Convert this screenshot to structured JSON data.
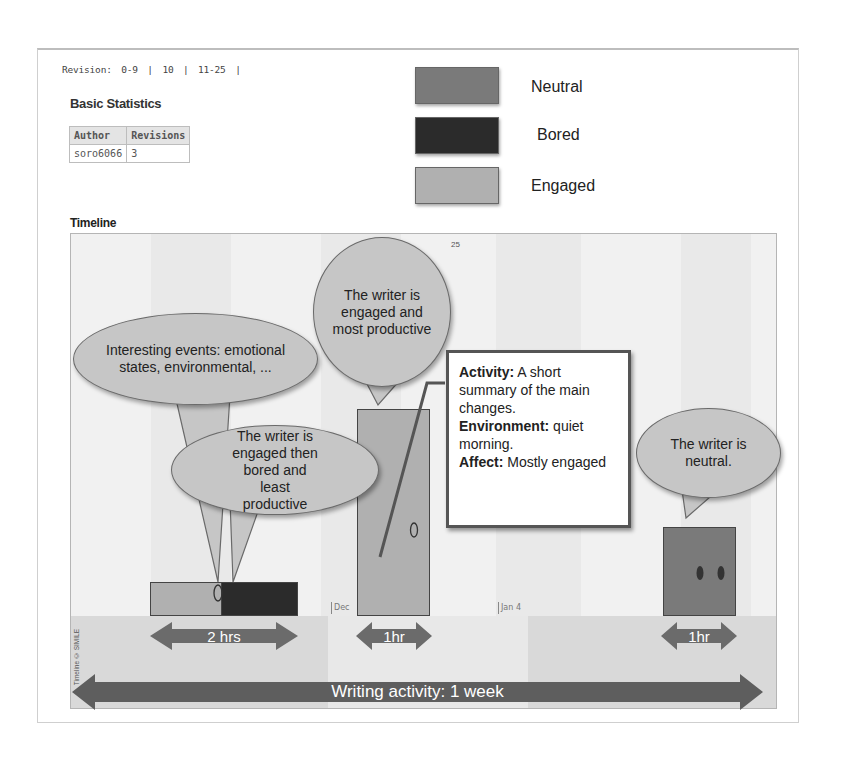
{
  "revisions": {
    "label": "Revision:",
    "links": [
      "0-9",
      "10",
      "11-25"
    ],
    "separator": "|"
  },
  "stats": {
    "title": "Basic Statistics",
    "columns": [
      "Author",
      "Revisions"
    ],
    "rows": [
      [
        "soro6066",
        "3"
      ]
    ]
  },
  "legend": [
    {
      "label": "Neutral",
      "color": "#7a7a7a"
    },
    {
      "label": "Bored",
      "color": "#2b2b2b"
    },
    {
      "label": "Engaged",
      "color": "#b0b0b0"
    }
  ],
  "timeline": {
    "title": "Timeline",
    "top_tick": "25",
    "ticks": [
      "Dec",
      "Jan 4"
    ],
    "credit": "Timeline © SIMILE"
  },
  "annotations": {
    "events_bubble": "Interesting events: emotional states, environmental, ...",
    "engaged_productive": "The writer is engaged and most productive",
    "engaged_bored": "The writer is engaged then bored and least productive",
    "neutral": "The writer is neutral.",
    "info_box": {
      "activity_label": "Activity:",
      "activity_text": " A short summary of the main changes.",
      "environment_label": "Environment:",
      "environment_text": " quiet morning.",
      "affect_label": "Affect:",
      "affect_text": " Mostly engaged"
    }
  },
  "durations": {
    "session1": "2 hrs",
    "session2": "1hr",
    "session3": "1hr",
    "overall": "Writing activity: 1 week"
  },
  "colors": {
    "engaged": "#b0b0b0",
    "bored": "#2b2b2b",
    "neutral": "#7a7a7a",
    "arrow": "#6b6b6b"
  }
}
